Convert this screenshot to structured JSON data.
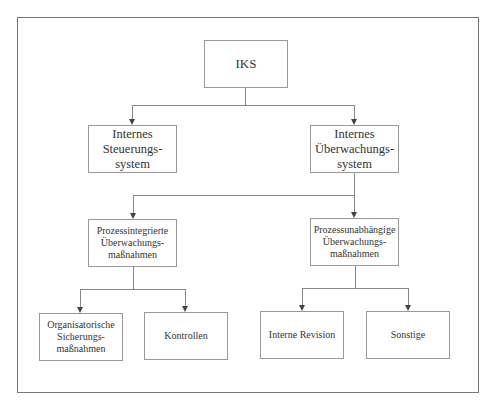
{
  "diagram": {
    "type": "hierarchy",
    "root": {
      "id": "iks",
      "label": "IKS"
    },
    "level1": [
      {
        "id": "steuerung",
        "label": "Internes\nSteuerungs-\nsystem"
      },
      {
        "id": "ueberwachung",
        "label": "Internes\nÜberwachungs-\nsystem"
      }
    ],
    "level2": [
      {
        "id": "prozessintegriert",
        "label": "Prozessintegrierte\nÜberwachungs-\nmaßnahmen",
        "parent": "ueberwachung"
      },
      {
        "id": "prozessunabhaengig",
        "label": "Prozessunabhängige\nÜberwachungs-\nmaßnahmen",
        "parent": "ueberwachung"
      }
    ],
    "level3": [
      {
        "id": "organisatorisch",
        "label": "Organisatorische\nSicherungs-\nmaßnahmen",
        "parent": "prozessintegriert"
      },
      {
        "id": "kontrollen",
        "label": "Kontrollen",
        "parent": "prozessintegriert"
      },
      {
        "id": "revision",
        "label": "Interne Revision",
        "parent": "prozessunabhaengig"
      },
      {
        "id": "sonstige",
        "label": "Sonstige",
        "parent": "prozessunabhaengig"
      }
    ]
  },
  "colors": {
    "border": "#999999",
    "line": "#888888",
    "text": "#333333"
  }
}
